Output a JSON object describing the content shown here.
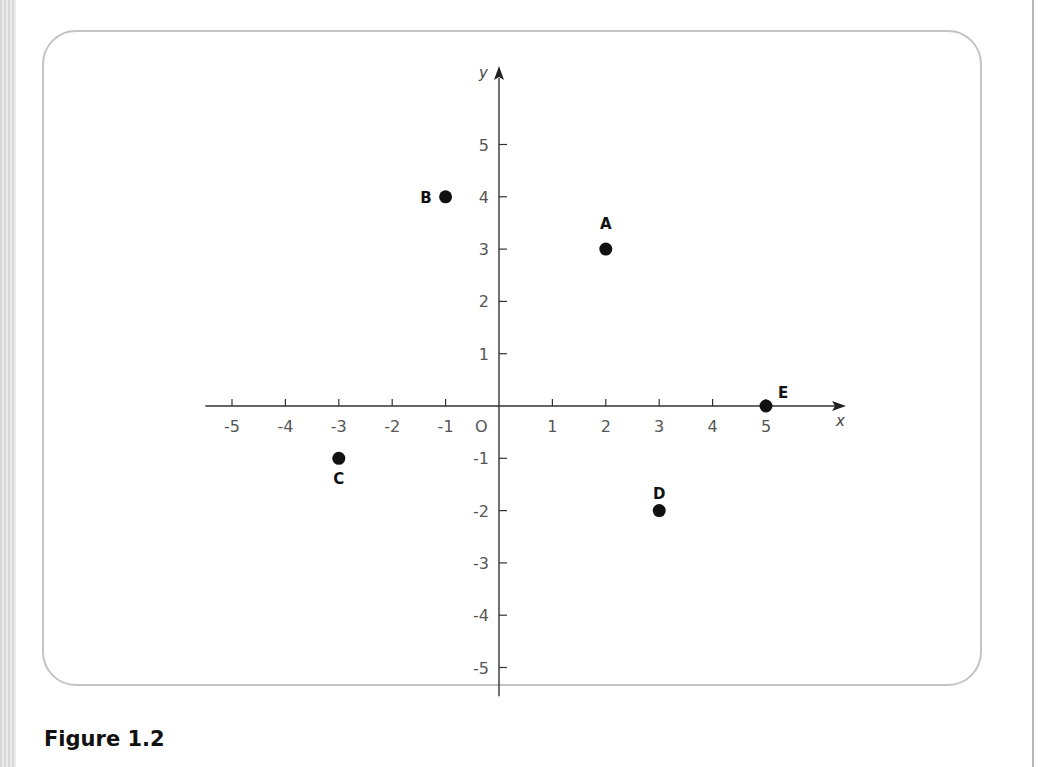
{
  "caption": "Figure 1.2",
  "chart_data": {
    "type": "scatter",
    "title": "",
    "xlabel": "x",
    "ylabel": "y",
    "origin_label": "O",
    "xlim": [
      -5.5,
      6.5
    ],
    "ylim": [
      -5.5,
      6.2
    ],
    "grid": false,
    "x_ticks": [
      -5,
      -4,
      -3,
      -2,
      -1,
      1,
      2,
      3,
      4,
      5
    ],
    "y_ticks": [
      5,
      4,
      3,
      2,
      1,
      -1,
      -2,
      -3,
      -4,
      -5
    ],
    "points": [
      {
        "label": "A",
        "x": 2,
        "y": 3
      },
      {
        "label": "B",
        "x": -1,
        "y": 4
      },
      {
        "label": "C",
        "x": -3,
        "y": -1
      },
      {
        "label": "D",
        "x": 3,
        "y": -2
      },
      {
        "label": "E",
        "x": 5,
        "y": 0
      }
    ]
  }
}
